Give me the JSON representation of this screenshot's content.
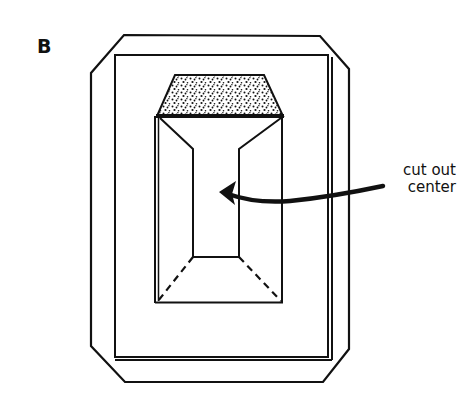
{
  "figure": {
    "panel_label": "B",
    "annotation": {
      "line1": "cut out",
      "line2": "center"
    },
    "colors": {
      "ink": "#111111",
      "background": "#ffffff"
    }
  }
}
